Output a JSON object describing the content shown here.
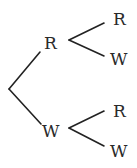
{
  "tree": {
    "first_level": {
      "upper": "R",
      "lower": "W"
    },
    "second_level": {
      "after_R": {
        "upper": "R",
        "lower": "W"
      },
      "after_W": {
        "upper": "R",
        "lower": "W"
      }
    }
  }
}
